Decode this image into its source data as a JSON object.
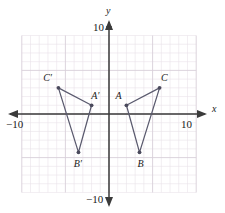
{
  "figure": {
    "type": "coordinate-plane-geometry",
    "axis_labels": {
      "x": "x",
      "y": "y"
    },
    "tick_labels": {
      "x_right": "10",
      "x_left": "−10",
      "y_top": "10",
      "y_bottom": "−10"
    },
    "colors": {
      "grid_minor": "#e9e2ea",
      "grid_major": "#d8cfd9",
      "axis": "#3b3b3b",
      "shape_stroke": "#5a5a6e",
      "vertex": "#4a4a5c",
      "text": "#1a1a1a",
      "background": "#ffffff"
    }
  },
  "chart_data": {
    "type": "scatter",
    "title": "",
    "xlabel": "x",
    "ylabel": "y",
    "xlim": [
      -10,
      10
    ],
    "ylim": [
      -10,
      10
    ],
    "xticks": [
      -10,
      10
    ],
    "yticks": [
      -10,
      10
    ],
    "grid": true,
    "grid_step": 1,
    "major_grid_step": 5,
    "series": [
      {
        "name": "Triangle ABC",
        "type": "polygon",
        "closed": true,
        "points": [
          {
            "label": "A",
            "x": 2.0,
            "y": 1.0,
            "label_dx": -0.9,
            "label_dy": 1.1
          },
          {
            "label": "B",
            "x": 3.5,
            "y": -4.4,
            "label_dx": 0.1,
            "label_dy": -1.3
          },
          {
            "label": "C",
            "x": 5.8,
            "y": 3.0,
            "label_dx": 0.5,
            "label_dy": 1.1
          }
        ]
      },
      {
        "name": "Triangle A'B'C'",
        "type": "polygon",
        "closed": true,
        "points": [
          {
            "label": "A′",
            "x": -2.0,
            "y": 1.0,
            "label_dx": 0.3,
            "label_dy": 1.1
          },
          {
            "label": "B′",
            "x": -3.5,
            "y": -4.4,
            "label_dx": -0.2,
            "label_dy": -1.3
          },
          {
            "label": "C′",
            "x": -5.8,
            "y": 3.0,
            "label_dx": -1.4,
            "label_dy": 1.1
          }
        ]
      }
    ],
    "annotations": []
  }
}
